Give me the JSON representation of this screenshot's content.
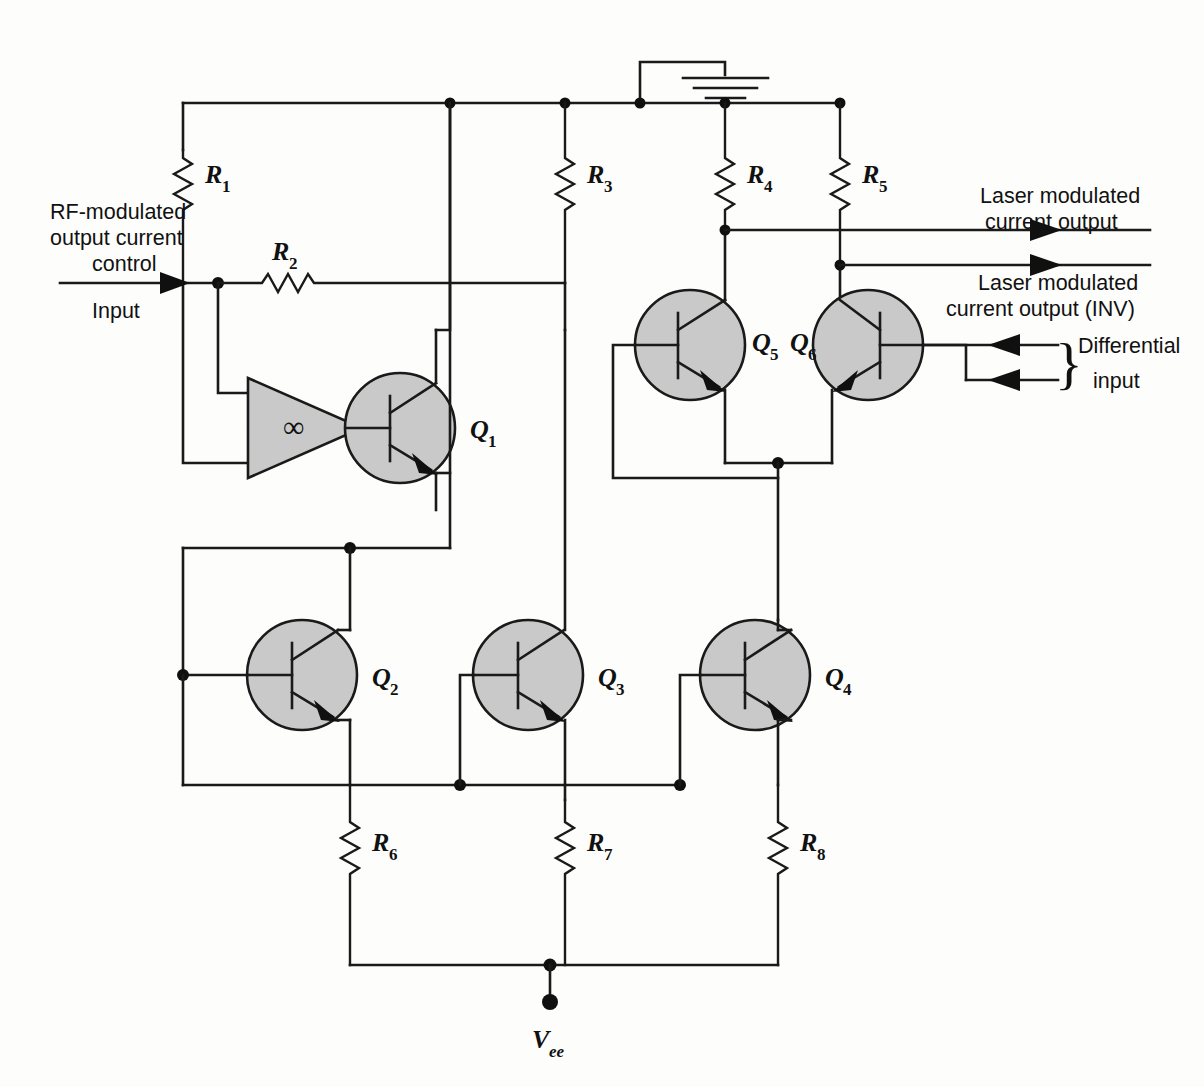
{
  "diagram": {
    "type": "electronic-schematic",
    "background_color": "#fdfdfc",
    "wire_color": "#1a1a1a",
    "device_fill_color": "#c9c9c9"
  },
  "labels": {
    "r1": "R",
    "r1_sub": "1",
    "r2": "R",
    "r2_sub": "2",
    "r3": "R",
    "r3_sub": "3",
    "r4": "R",
    "r4_sub": "4",
    "r5": "R",
    "r5_sub": "5",
    "r6": "R",
    "r6_sub": "6",
    "r7": "R",
    "r7_sub": "7",
    "r8": "R",
    "r8_sub": "8",
    "q1": "Q",
    "q1_sub": "1",
    "q2": "Q",
    "q2_sub": "2",
    "q3": "Q",
    "q3_sub": "3",
    "q4": "Q",
    "q4_sub": "4",
    "q5": "Q",
    "q5_sub": "5",
    "q6": "Q",
    "q6_sub": "6",
    "vee": "V",
    "vee_sub": "ee",
    "opamp_symbol": "∞"
  },
  "annotations": {
    "input_line1": "RF-modulated",
    "input_line2": "output current",
    "input_line3": "control",
    "input_line4": "Input",
    "output1_line1": "Laser modulated",
    "output1_line2": "current output",
    "output2_line1": "Laser modulated",
    "output2_line2": "current output (INV)",
    "diff_line1": "Differential",
    "diff_line2": "input",
    "brace_glyph": "}"
  },
  "components": {
    "resistors": [
      {
        "name": "R1",
        "x": 183,
        "y_top": 103,
        "y_bot": 283,
        "label_x": 205,
        "label_y": 180
      },
      {
        "name": "R2",
        "x_left": 218,
        "x_right": 565,
        "y": 283,
        "label_x": 285,
        "label_y": 258
      },
      {
        "name": "R3",
        "x": 565,
        "y_top": 103,
        "y_bot": 283,
        "label_x": 587,
        "label_y": 180
      },
      {
        "name": "R4",
        "x": 725,
        "y_top": 103,
        "y_bot": 230,
        "label_x": 747,
        "label_y": 180
      },
      {
        "name": "R5",
        "x": 840,
        "y_top": 103,
        "y_bot": 265,
        "label_x": 862,
        "label_y": 180
      },
      {
        "name": "R6",
        "x": 350,
        "y_top": 785,
        "y_bot": 965,
        "label_x": 372,
        "label_y": 848
      },
      {
        "name": "R7",
        "x": 550,
        "y_top": 785,
        "y_bot": 965,
        "label_x": 572,
        "label_y": 848
      },
      {
        "name": "R8",
        "x": 778,
        "y_top": 785,
        "y_bot": 965,
        "label_x": 800,
        "label_y": 848
      }
    ],
    "transistors": [
      {
        "name": "Q1",
        "cx": 400,
        "cy": 428,
        "r": 55,
        "orientation": "npn-left-base",
        "label_x": 470,
        "label_y": 436
      },
      {
        "name": "Q2",
        "cx": 302,
        "cy": 675,
        "r": 55,
        "orientation": "npn-left-base",
        "label_x": 372,
        "label_y": 683
      },
      {
        "name": "Q3",
        "cx": 528,
        "cy": 675,
        "r": 55,
        "orientation": "npn-left-base",
        "label_x": 598,
        "label_y": 683
      },
      {
        "name": "Q4",
        "cx": 755,
        "cy": 675,
        "r": 55,
        "orientation": "npn-left-base",
        "label_x": 825,
        "label_y": 683
      },
      {
        "name": "Q5",
        "cx": 690,
        "cy": 345,
        "r": 55,
        "orientation": "npn-left-base",
        "label_x": 752,
        "label_y": 348
      },
      {
        "name": "Q6",
        "cx": 868,
        "cy": 345,
        "r": 55,
        "orientation": "npn-right-base",
        "label_x": 800,
        "label_y": 348
      }
    ],
    "amplifier": {
      "name": "op-amp",
      "x_left": 248,
      "x_right": 360,
      "y_top": 378,
      "y_bot": 478,
      "symbol": "∞"
    },
    "ground": {
      "x": 640,
      "y_rail": 103,
      "stem_top": 62,
      "bar_x": 725
    },
    "supply_terminal": {
      "name": "Vee",
      "x": 550,
      "y": 1002
    }
  },
  "nets": {
    "top_rail_y": 103,
    "top_rail_x_start": 183,
    "top_rail_x_end": 840,
    "top_rail_nodes": [
      450,
      565,
      640,
      725,
      840
    ],
    "mid_bus_y": 785,
    "bottom_rail_y": 965,
    "diff_pair_emitter_node": {
      "x": 778,
      "y": 463
    },
    "q1_emitter_node": {
      "x": 350,
      "y": 548
    }
  }
}
